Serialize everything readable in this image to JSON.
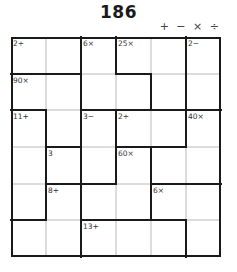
{
  "title": "186",
  "operators": "+ − × ÷",
  "grid": {
    "size": 6,
    "cages": [
      {
        "clue": "2÷",
        "cells": [
          [
            0,
            0
          ],
          [
            0,
            1
          ]
        ]
      },
      {
        "clue": "6×",
        "cells": [
          [
            0,
            2
          ],
          [
            1,
            2
          ],
          [
            1,
            3
          ]
        ]
      },
      {
        "clue": "25×",
        "cells": [
          [
            0,
            3
          ],
          [
            0,
            4
          ],
          [
            1,
            4
          ]
        ]
      },
      {
        "clue": "2−",
        "cells": [
          [
            0,
            5
          ],
          [
            1,
            5
          ]
        ]
      },
      {
        "clue": "90×",
        "cells": [
          [
            1,
            0
          ],
          [
            1,
            1
          ],
          [
            2,
            1
          ]
        ]
      },
      {
        "clue": "11+",
        "cells": [
          [
            2,
            0
          ],
          [
            3,
            0
          ],
          [
            4,
            0
          ]
        ]
      },
      {
        "clue": "3−",
        "cells": [
          [
            2,
            2
          ],
          [
            3,
            2
          ]
        ]
      },
      {
        "clue": "2÷",
        "cells": [
          [
            2,
            3
          ],
          [
            2,
            4
          ]
        ]
      },
      {
        "clue": "40×",
        "cells": [
          [
            2,
            5
          ],
          [
            3,
            4
          ],
          [
            3,
            5
          ]
        ]
      },
      {
        "clue": "3",
        "cells": [
          [
            3,
            1
          ]
        ]
      },
      {
        "clue": "60×",
        "cells": [
          [
            3,
            3
          ],
          [
            4,
            2
          ],
          [
            4,
            3
          ]
        ]
      },
      {
        "clue": "8+",
        "cells": [
          [
            4,
            1
          ],
          [
            5,
            0
          ],
          [
            5,
            1
          ]
        ]
      },
      {
        "clue": "6×",
        "cells": [
          [
            4,
            4
          ],
          [
            4,
            5
          ],
          [
            5,
            5
          ]
        ]
      },
      {
        "clue": "13+",
        "cells": [
          [
            5,
            2
          ],
          [
            5,
            3
          ],
          [
            5,
            4
          ]
        ]
      }
    ]
  }
}
